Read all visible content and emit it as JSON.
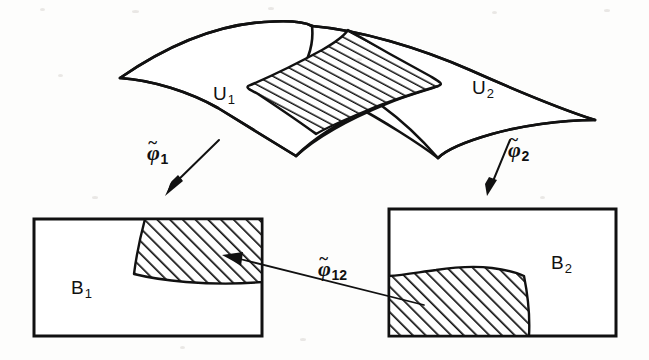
{
  "figure": {
    "kind": "manifold-chart-diagram",
    "background_color": "#fdfdfc",
    "ink_color": "#111111"
  },
  "surface": {
    "name": "two-overlapping-coordinate-patches",
    "patch_left_label": "U",
    "patch_left_sub": "1",
    "patch_right_label": "U",
    "patch_right_sub": "2",
    "overlap_hatched": true
  },
  "boxes": [
    {
      "id": "B1",
      "label": "B",
      "sub": "1",
      "hatched_corner": "top-right"
    },
    {
      "id": "B2",
      "label": "B",
      "sub": "2",
      "hatched_corner": "bottom-left"
    }
  ],
  "maps": [
    {
      "id": "phi1",
      "glyph": "φ",
      "tilde": "~",
      "sub": "1",
      "direction": "down-left"
    },
    {
      "id": "phi2",
      "glyph": "φ",
      "tilde": "~",
      "sub": "2",
      "direction": "down"
    },
    {
      "id": "phi12",
      "glyph": "φ",
      "tilde": "~",
      "sub": "12",
      "direction": "right-to-left"
    }
  ]
}
